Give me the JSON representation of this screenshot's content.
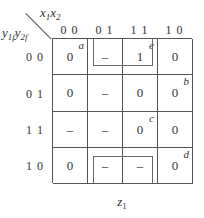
{
  "kmap": {
    "col_var": {
      "base1": "x",
      "sub1": "1",
      "base2": "x",
      "sub2": "2"
    },
    "row_var": {
      "base1": "y",
      "sub1": "1f",
      "base2": "y",
      "sub2": "2f"
    },
    "columns": [
      "0 0",
      "0 1",
      "1 1",
      "1 0"
    ],
    "rows": [
      "0 0",
      "0 1",
      "1 1",
      "1 0"
    ],
    "cells": [
      [
        {
          "value": "0",
          "tag": "a"
        },
        {
          "value": "–",
          "tag": ""
        },
        {
          "value": "1",
          "tag": "e"
        },
        {
          "value": "0",
          "tag": ""
        }
      ],
      [
        {
          "value": "0",
          "tag": ""
        },
        {
          "value": "–",
          "tag": ""
        },
        {
          "value": "0",
          "tag": ""
        },
        {
          "value": "0",
          "tag": "b"
        }
      ],
      [
        {
          "value": "–",
          "tag": ""
        },
        {
          "value": "–",
          "tag": ""
        },
        {
          "value": "0",
          "tag": "c"
        },
        {
          "value": "0",
          "tag": ""
        }
      ],
      [
        {
          "value": "0",
          "tag": ""
        },
        {
          "value": "–",
          "tag": ""
        },
        {
          "value": "–",
          "tag": ""
        },
        {
          "value": "0",
          "tag": "d"
        }
      ]
    ],
    "groupings": [
      {
        "description": "wrap-around group top row",
        "row": 0,
        "cols": [
          1,
          2
        ]
      },
      {
        "description": "wrap-around group bottom row",
        "row": 3,
        "cols": [
          1,
          2
        ]
      }
    ],
    "caption": {
      "base": "z",
      "sub": "1"
    }
  }
}
